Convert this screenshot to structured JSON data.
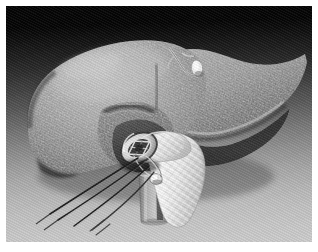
{
  "figure": {
    "kind": "medical-illustration",
    "modality": "grayscale airbrush / stipple rendering",
    "width": 318,
    "height": 252,
    "border_color": "#ffffff",
    "border_width_px": 6
  },
  "background": {
    "name": "studio-gradient",
    "top_color": "#050505",
    "mid_color": "#7a7a7a",
    "bottom_color": "#cdcdcd",
    "texture": "diagonal hatch"
  },
  "palette": {
    "liver_light": "#b9b9b9",
    "liver_mid": "#8e8e8e",
    "liver_dark": "#4a4a4a",
    "liver_shadow": "#2b2b2b",
    "graft_white": "#f2f2f2",
    "graft_shade": "#c4c4c4",
    "suture_black": "#1c1c1c",
    "metal_highlight": "#ffffff",
    "cylinder_gray": "#9a9a9a"
  },
  "structures": [
    {
      "id": "left-lobe",
      "label": "Left hepatic lobe",
      "tone": "#9a9a9a"
    },
    {
      "id": "right-lobe",
      "label": "Right hepatic lobe",
      "tone": "#8a8a8a"
    },
    {
      "id": "quadrate-lobe",
      "label": "Quadrate lobe",
      "tone": "#6f6f6f"
    },
    {
      "id": "caudate-lobe",
      "label": "Caudate lobe",
      "tone": "#5a5a5a"
    },
    {
      "id": "inferior-edge",
      "label": "Inferior hepatic margin",
      "tone": "#3a3a3a"
    },
    {
      "id": "falciform",
      "label": "Falciform ligament remnant",
      "tone": "#d0d0d0"
    },
    {
      "id": "surface-nodule",
      "label": "Surface highlight nodule",
      "tone": "#e9e9e9"
    },
    {
      "id": "vessel-stump",
      "label": "Transected vessel stump with open lumen",
      "tone": "#dedede"
    },
    {
      "id": "woven-graft",
      "label": "Woven vascular graft / umbilical tape",
      "tone": "#f2f2f2"
    },
    {
      "id": "cylinder-probe",
      "label": "Cylindrical probe behind graft",
      "tone": "#9a9a9a"
    },
    {
      "id": "knot-bead",
      "label": "Suture knot bead",
      "tone": "#ededed"
    },
    {
      "id": "suture-threads",
      "label": "Traction suture threads",
      "tone": "#1c1c1c",
      "count": 4
    }
  ],
  "annotations": {
    "visible_text": "",
    "labels_shown": false,
    "callouts": []
  }
}
